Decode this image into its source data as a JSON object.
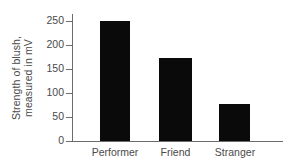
{
  "chart_data": {
    "type": "bar",
    "title": "",
    "xlabel": "",
    "ylabel": "Strength of blush, measured in mV",
    "ylabel_line1": "Strength of blush,",
    "ylabel_line2": "measured in mV",
    "categories": [
      "Performer",
      "Friend",
      "Stranger"
    ],
    "values": [
      250,
      175,
      77
    ],
    "ylim": [
      0,
      250
    ],
    "yticks": [
      0,
      50,
      100,
      150,
      200,
      250
    ],
    "ytick_labels": [
      "0",
      "50",
      "100",
      "150",
      "200",
      "250"
    ],
    "grid": false,
    "legend": false,
    "bar_color": "#0a0a0a",
    "axis_color": "#6b6b6b",
    "text_color": "#4a4a4a",
    "background_color": "#ffffff"
  },
  "axis": {
    "ticks": [
      {
        "label": "250",
        "y": 21
      },
      {
        "label": "200",
        "y": 45
      },
      {
        "label": "150",
        "y": 69
      },
      {
        "label": "100",
        "y": 93
      },
      {
        "label": "50",
        "y": 117
      },
      {
        "label": "0",
        "y": 141
      }
    ]
  },
  "bars": [
    {
      "label": "Performer",
      "value": 250,
      "left": 100,
      "width": 30,
      "top": 21,
      "height": 120,
      "label_left": 89,
      "label_width": 52
    },
    {
      "label": "Friend",
      "value": 175,
      "left": 159,
      "width": 33,
      "top": 58,
      "height": 83,
      "label_left": 152,
      "label_width": 47
    },
    {
      "label": "Stranger",
      "value": 77,
      "left": 219,
      "width": 31,
      "top": 104,
      "height": 37,
      "label_left": 209,
      "label_width": 52
    }
  ]
}
